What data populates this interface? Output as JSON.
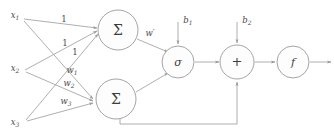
{
  "diagram": {
    "colors": {
      "stroke": "#9a9a9a",
      "text": "#4a4a4a",
      "node_fill": "#fdfdfd",
      "background": "#ffffff"
    },
    "inputs": [
      {
        "id": "x1",
        "base": "x",
        "sub": "1"
      },
      {
        "id": "x2",
        "base": "x",
        "sub": "2"
      },
      {
        "id": "x3",
        "base": "x",
        "sub": "3"
      }
    ],
    "top_edge_weights": [
      {
        "id": "w-top-1",
        "label": "1"
      },
      {
        "id": "w-top-2",
        "label": "1"
      },
      {
        "id": "w-top-3",
        "label": "1"
      }
    ],
    "bottom_edge_weights": [
      {
        "id": "w1",
        "base": "w",
        "sub": "1"
      },
      {
        "id": "w2",
        "base": "w",
        "sub": "2"
      },
      {
        "id": "w3",
        "base": "w",
        "sub": "3"
      }
    ],
    "nodes": [
      {
        "id": "sum-top",
        "glyph": "Σ",
        "name": "summation-node-top"
      },
      {
        "id": "sum-bottom",
        "glyph": "Σ",
        "name": "summation-node-bottom"
      },
      {
        "id": "sigmoid",
        "glyph": "σ",
        "name": "sigmoid-node"
      },
      {
        "id": "adder",
        "glyph": "+",
        "name": "adder-node"
      },
      {
        "id": "activation",
        "glyph": "f",
        "name": "activation-node"
      }
    ],
    "connection_labels": {
      "w_prime": "w′",
      "bias1_base": "b",
      "bias1_sub": "1",
      "bias2_base": "b",
      "bias2_sub": "2"
    }
  }
}
